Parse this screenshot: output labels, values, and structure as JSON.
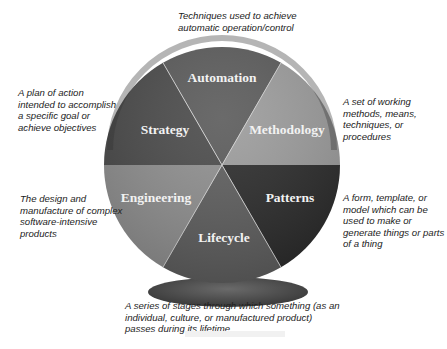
{
  "diagram": {
    "center": {
      "x": 222,
      "y": 165
    },
    "radius": 118,
    "segments": [
      {
        "id": "automation",
        "label": "Automation",
        "color": "#5a5a5a",
        "description": "Techniques used to achieve automatic operation/control"
      },
      {
        "id": "methodology",
        "label": "Methodology",
        "color": "#9a9a9a",
        "description": "A set of working methods, means, techniques, or procedures"
      },
      {
        "id": "patterns",
        "label": "Patterns",
        "color": "#2b2b2b",
        "description": "A form, template, or model which can be used to make or generate things or parts of a thing"
      },
      {
        "id": "lifecycle",
        "label": "Lifecycle",
        "color": "#5e5e5e",
        "description": "A series of stages through which something (as an individual, culture, or manufactured product) passes during its lifetime"
      },
      {
        "id": "engineering",
        "label": "Engineering",
        "color": "#8f8f8f",
        "description": "The design and manufacture of complex software-intensive products"
      },
      {
        "id": "strategy",
        "label": "Strategy",
        "color": "#4a4a4a",
        "description": "A plan of action intended to accomplish a specific goal or achieve objectives"
      }
    ],
    "pedestal_color": "#4d4d4d",
    "divider_color": "#cfcfcf"
  }
}
